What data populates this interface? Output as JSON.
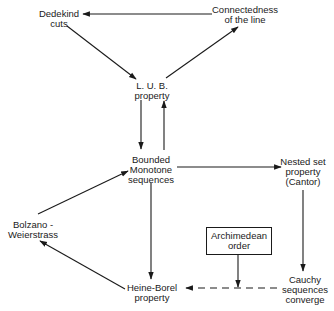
{
  "diagram": {
    "nodes": {
      "dedekind": {
        "lines": [
          "Dedekind",
          "cuts"
        ]
      },
      "connectedness": {
        "lines": [
          "Connectedness",
          "of the line"
        ]
      },
      "lub": {
        "lines": [
          "L. U. B.",
          "property"
        ]
      },
      "bounded_monotone": {
        "lines": [
          "Bounded",
          "Monotone",
          "sequences"
        ]
      },
      "nested_set": {
        "lines": [
          "Nested set",
          "property",
          "(Cantor)"
        ]
      },
      "bolzano": {
        "lines": [
          "Bolzano -",
          "Weierstrass"
        ]
      },
      "archimedean": {
        "lines": [
          "Archimedean",
          "order"
        ]
      },
      "heine_borel": {
        "lines": [
          "Heine-Borel",
          "property"
        ]
      },
      "cauchy": {
        "lines": [
          "Cauchy",
          "sequences",
          "converge"
        ]
      }
    },
    "edges": [
      {
        "from": "connectedness",
        "to": "dedekind",
        "style": "solid"
      },
      {
        "from": "dedekind",
        "to": "lub",
        "style": "solid"
      },
      {
        "from": "lub",
        "to": "connectedness",
        "style": "solid"
      },
      {
        "from": "lub",
        "to": "bounded_monotone",
        "style": "solid"
      },
      {
        "from": "bounded_monotone",
        "to": "lub",
        "style": "solid"
      },
      {
        "from": "bounded_monotone",
        "to": "nested_set",
        "style": "solid"
      },
      {
        "from": "nested_set",
        "to": "cauchy",
        "style": "solid"
      },
      {
        "from": "bolzano",
        "to": "bounded_monotone",
        "style": "solid"
      },
      {
        "from": "bounded_monotone",
        "to": "heine_borel",
        "style": "solid"
      },
      {
        "from": "heine_borel",
        "to": "bolzano",
        "style": "solid"
      },
      {
        "from": "cauchy",
        "to": "heine_borel",
        "style": "dashed"
      },
      {
        "from": "archimedean",
        "to": "cauchy-heine_borel-edge",
        "style": "solid"
      }
    ],
    "colors": {
      "ink": "#1a1a1a",
      "background": "#ffffff"
    }
  }
}
